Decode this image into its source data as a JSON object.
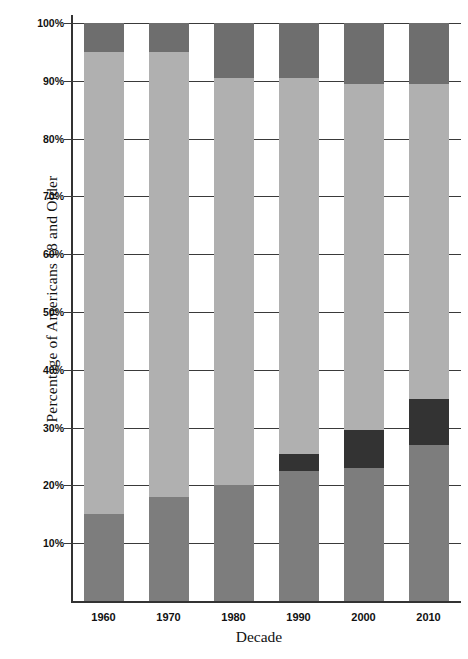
{
  "chart_data": {
    "type": "bar",
    "stacked": true,
    "title": "",
    "xlabel": "Decade",
    "ylabel": "Percentage of Americans 18 and Older",
    "categories": [
      "1960",
      "1970",
      "1980",
      "1990",
      "2000",
      "2010"
    ],
    "ylim": [
      0,
      100
    ],
    "ytick_labels": [
      "10%",
      "20%",
      "30%",
      "40%",
      "50%",
      "60%",
      "70%",
      "80%",
      "90%",
      "100%"
    ],
    "ytick_values": [
      10,
      20,
      30,
      40,
      50,
      60,
      70,
      80,
      90,
      100
    ],
    "grid": true,
    "legend": "none",
    "series": [
      {
        "name": "never-married",
        "color": "#7d7d7d",
        "values": [
          15,
          18,
          20,
          22.5,
          23,
          27
        ]
      },
      {
        "name": "divorced-or-widowed",
        "color": "#333333",
        "values": [
          0,
          0,
          0,
          3,
          6.5,
          8
        ]
      },
      {
        "name": "married",
        "color": "#b0b0b0",
        "values": [
          80,
          77,
          70.5,
          65,
          60,
          54.5
        ]
      },
      {
        "name": "other",
        "color": "#6e6e6e",
        "values": [
          5,
          5,
          9.5,
          9.5,
          10.5,
          10.5
        ]
      }
    ],
    "stack_order_bottom_to_top": [
      "never-married",
      "divorced-or-widowed",
      "married",
      "other"
    ],
    "segment_boundaries_percent": {
      "1960": [
        0,
        15,
        15,
        95,
        100
      ],
      "1970": [
        0,
        18,
        18,
        95,
        100
      ],
      "1980": [
        0,
        20,
        20,
        90.5,
        100
      ],
      "1990": [
        0,
        22.5,
        25.5,
        90.5,
        100
      ],
      "2000": [
        0,
        23,
        29.5,
        89.5,
        100
      ],
      "2010": [
        0,
        27,
        35,
        89.5,
        100
      ]
    }
  },
  "colors": {
    "mid_gray": "#7d7d7d",
    "light_gray": "#b0b0b0",
    "dark_gray": "#6e6e6e",
    "black_segment": "#333333",
    "axis": "#333333",
    "grid": "#3a3a3a",
    "background": "#ffffff"
  }
}
